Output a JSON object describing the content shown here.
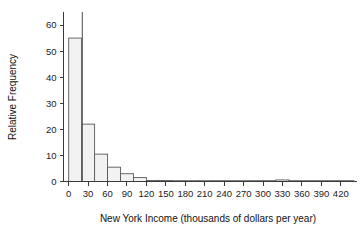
{
  "chart_data": {
    "type": "bar",
    "title": "",
    "subtitle": "",
    "xlabel": "New York Income (thousands of dollars per year)",
    "ylabel": "Relative Frequency",
    "grid": false,
    "legend": "none",
    "xlim": [
      -8,
      445
    ],
    "ylim": [
      0,
      65
    ],
    "bin_width": 20,
    "x_ticks": [
      0,
      30,
      60,
      90,
      120,
      150,
      180,
      210,
      240,
      270,
      300,
      330,
      360,
      390,
      420
    ],
    "x_tick_labels": [
      "0",
      "30",
      "60",
      "90",
      "120",
      "150",
      "180",
      "210",
      "240",
      "270",
      "300",
      "330",
      "360",
      "390",
      "420"
    ],
    "y_ticks": [
      0,
      10,
      20,
      30,
      40,
      50,
      60
    ],
    "y_tick_labels": [
      "0",
      "10",
      "20",
      "30",
      "40",
      "50",
      "60"
    ],
    "bin_edges": [
      0,
      20,
      40,
      60,
      80,
      100,
      120,
      140,
      160,
      180,
      200,
      220,
      240,
      260,
      280,
      300,
      320,
      340,
      360,
      380,
      400,
      420,
      440
    ],
    "values": [
      55,
      22,
      10.5,
      5.5,
      3,
      1.5,
      0.4,
      0.4,
      0.3,
      0.0,
      0.25,
      0.25,
      0.25,
      0.0,
      0.0,
      0.0,
      0.6,
      0.0,
      0.0,
      0.0,
      0.0,
      0.3
    ],
    "categories": [
      "0-20",
      "20-40",
      "40-60",
      "60-80",
      "80-100",
      "100-120",
      "120-140",
      "140-160",
      "160-180",
      "180-200",
      "200-220",
      "220-240",
      "240-260",
      "260-280",
      "280-300",
      "300-320",
      "320-340",
      "340-360",
      "360-380",
      "380-400",
      "400-420",
      "420-440"
    ],
    "annotations": [
      {
        "name": "vertical-reference-line",
        "x": 21,
        "y_top": 65,
        "y_bottom": 0
      }
    ],
    "colors": {
      "bar_fill": "#f2f2f2",
      "bar_stroke": "#595959",
      "axis": "#3a3a3a",
      "text": "#1a1a1a",
      "reference_line": "#4a4a4a",
      "background": "#ffffff"
    }
  }
}
